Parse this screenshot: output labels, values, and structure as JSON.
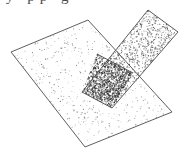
{
  "figure": {
    "caption_fragment_above": "y pp g",
    "background_color": "#ffffff",
    "outline_color": "#4d4d4d",
    "outline_width": 0.9,
    "stipple": {
      "plane_color": "#777777",
      "strip_color": "#555555",
      "overlap_color": "#2b2b2b",
      "plane_density": 0.055,
      "strip_density": 0.3,
      "overlap_density": 0.62,
      "dot_radius_plane": 0.45,
      "dot_radius_strip": 0.5,
      "dot_radius_overlap": 0.55
    },
    "shapes": [
      {
        "name": "large-plane",
        "label": "Large horizontal plane",
        "fill_tone": "light-stipple",
        "points": [
          [
            11,
            52
          ],
          [
            88,
            20
          ],
          [
            172,
            112
          ],
          [
            85,
            147
          ]
        ]
      },
      {
        "name": "diagonal-strip",
        "label": "Narrow inclined plane strip",
        "fill_tone": "medium-stipple",
        "points": [
          [
            148,
            10
          ],
          [
            178,
            32
          ],
          [
            112,
            108
          ],
          [
            82,
            92
          ]
        ]
      },
      {
        "name": "overlap-region",
        "label": "Intersection of the two planes",
        "fill_tone": "dark-stipple",
        "points": [
          [
            97,
            54
          ],
          [
            133,
            73
          ],
          [
            112,
            108
          ],
          [
            82,
            92
          ]
        ]
      }
    ],
    "intersection_line": {
      "name": "intersection-line",
      "from": [
        97,
        54
      ],
      "to": [
        133,
        73
      ]
    }
  }
}
